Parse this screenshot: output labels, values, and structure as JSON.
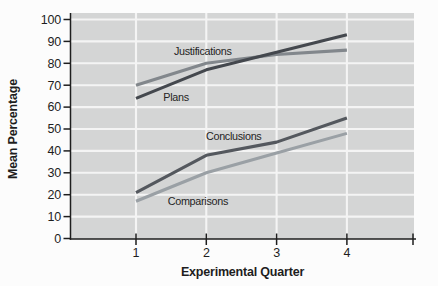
{
  "chart_data": {
    "type": "line",
    "title": "",
    "xlabel": "Experimental Quarter",
    "ylabel": "Mean Percentage",
    "x": [
      1,
      2,
      3,
      4
    ],
    "x_tick_labels": [
      "1",
      "2",
      "3",
      "4"
    ],
    "ylim": [
      0,
      100
    ],
    "y_ticks": [
      0,
      10,
      20,
      30,
      40,
      50,
      60,
      70,
      80,
      90,
      100
    ],
    "grid": true,
    "legend_position": "inline-labels",
    "colors": {
      "plot_background": "#d4d5d5",
      "gridline": "#f4f4f4",
      "axis": "#1e1e1e",
      "text": "#1e1e1e"
    },
    "series": [
      {
        "name": "Justifications",
        "values": [
          70,
          80,
          84,
          86
        ],
        "color": "#82878c",
        "label_at": {
          "x": 1.95,
          "y": 85.5
        }
      },
      {
        "name": "Plans",
        "values": [
          64,
          77,
          85,
          93
        ],
        "color": "#44484e",
        "label_at": {
          "x": 1.57,
          "y": 64.5
        }
      },
      {
        "name": "Conclusions",
        "values": [
          21,
          38,
          44,
          55
        ],
        "color": "#54585e",
        "label_at": {
          "x": 2.39,
          "y": 46.5
        }
      },
      {
        "name": "Comparisons",
        "values": [
          17,
          30,
          39,
          48
        ],
        "color": "#9aa0a5",
        "label_at": {
          "x": 1.88,
          "y": 17.0
        }
      }
    ]
  }
}
